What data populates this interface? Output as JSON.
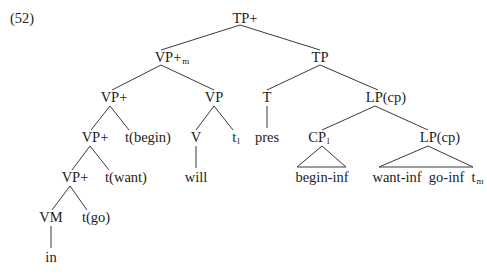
{
  "example_number": "(52)",
  "tree": {
    "root": {
      "label": "TP+",
      "sub": ""
    },
    "vp_m": {
      "label": "VP+",
      "sub": "m"
    },
    "vp_plus_1": {
      "label": "VP+",
      "sub": ""
    },
    "vp": {
      "label": "VP",
      "sub": ""
    },
    "vp_plus_2": {
      "label": "VP+",
      "sub": ""
    },
    "t_begin": {
      "label": "t(begin)",
      "sub": ""
    },
    "v": {
      "label": "V",
      "sub": ""
    },
    "t_l": {
      "label": "t",
      "sub": "l"
    },
    "will": {
      "label": "will",
      "sub": ""
    },
    "vp_plus_3": {
      "label": "VP+",
      "sub": ""
    },
    "t_want": {
      "label": "t(want)",
      "sub": ""
    },
    "vm": {
      "label": "VM",
      "sub": ""
    },
    "t_go": {
      "label": "t(go)",
      "sub": ""
    },
    "in": {
      "label": "in",
      "sub": ""
    },
    "tp": {
      "label": "TP",
      "sub": ""
    },
    "t": {
      "label": "T",
      "sub": ""
    },
    "pres": {
      "label": "pres",
      "sub": ""
    },
    "lp_cp_1": {
      "label": "LP(cp)",
      "sub": ""
    },
    "cp_l": {
      "label": "CP",
      "sub": "l"
    },
    "begin_inf": {
      "label": "begin-inf",
      "sub": ""
    },
    "lp_cp_2": {
      "label": "LP(cp)",
      "sub": ""
    },
    "lp_terminals": {
      "label": "want-inf  go-inf  t",
      "sub": "m"
    }
  }
}
